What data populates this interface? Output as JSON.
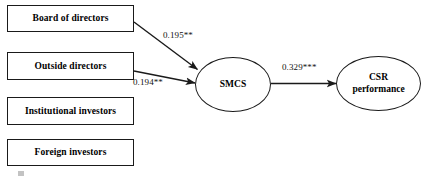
{
  "figure": {
    "type": "path-diagram",
    "background_color": "#ffffff",
    "stroke_color": "#1a1a1a",
    "text_color": "#000000"
  },
  "nodes": {
    "boxes": [
      {
        "id": "board-of-directors",
        "label": "Board of directors",
        "x": 7,
        "y": 5,
        "w": 127,
        "h": 27
      },
      {
        "id": "outside-directors",
        "label": "Outside directors",
        "x": 7,
        "y": 52,
        "w": 127,
        "h": 28
      },
      {
        "id": "institutional-investors",
        "label": "Institutional investors",
        "x": 7,
        "y": 97,
        "w": 127,
        "h": 28
      },
      {
        "id": "foreign-investors",
        "label": "Foreign investors",
        "x": 7,
        "y": 139,
        "w": 127,
        "h": 27
      }
    ],
    "ellipses": [
      {
        "id": "smcs",
        "label_line1": "SMCS",
        "label_line2": "",
        "x": 195,
        "y": 57,
        "w": 76,
        "h": 55
      },
      {
        "id": "csr-performance",
        "label_line1": "CSR",
        "label_line2": "performance",
        "x": 336,
        "y": 56,
        "w": 85,
        "h": 55
      }
    ]
  },
  "edges": [
    {
      "id": "board-to-smcs",
      "from": "board-of-directors",
      "to": "smcs",
      "coefficient": "0.195**",
      "label_x": 163,
      "label_y": 30
    },
    {
      "id": "outside-to-smcs",
      "from": "outside-directors",
      "to": "smcs",
      "coefficient": "0.194**",
      "label_x": 133,
      "label_y": 77
    },
    {
      "id": "smcs-to-csr",
      "from": "smcs",
      "to": "csr-performance",
      "coefficient": "0.329***",
      "label_x": 282,
      "label_y": 62
    }
  ]
}
